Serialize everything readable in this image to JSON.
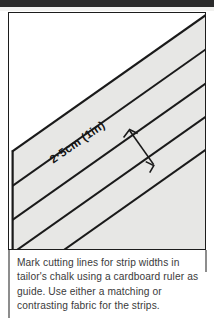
{
  "page": {
    "title": "Mark cutting lines for strip widths",
    "background_color": "#ffffff"
  },
  "top_band": {
    "color": "#2b2b2b"
  },
  "illustration": {
    "name": "fabric-strip-cutting-diagram",
    "frame_color": "#1c1c1c",
    "fabric_fill": "#e7e7e5",
    "background_fill": "#ffffff",
    "line_color": "#1a1a1a",
    "measurement_label": "2·5cm (1in)",
    "description": "Fabric laid on the bias with four parallel diagonal cutting lines marked across it, and a perpendicular double-headed dimension arrow showing the strip width."
  },
  "caption": {
    "lines": [
      "Mark cutting lines for strip widths in",
      "tailor's chalk using a cardboard ruler as",
      "guide. Use either a matching or",
      "contrasting fabric for the strips."
    ],
    "text_color": "#3a3a3a"
  }
}
